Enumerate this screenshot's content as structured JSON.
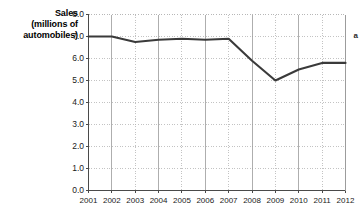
{
  "chart_data": {
    "type": "line",
    "title": "",
    "xlabel": "",
    "ylabel": "Sales (millions of automobiles)",
    "ylabel_lines": [
      "Sales",
      "(millions of",
      "automobiles)"
    ],
    "categories": [
      "2001",
      "2002",
      "2003",
      "2004",
      "2005",
      "2006",
      "2007",
      "2008",
      "2009",
      "2010",
      "2011",
      "2012"
    ],
    "values": [
      7.0,
      7.0,
      6.75,
      6.85,
      6.9,
      6.85,
      6.9,
      5.9,
      5.0,
      5.5,
      5.8,
      5.8
    ],
    "series": [
      {
        "name": "Sales",
        "values": [
          7.0,
          7.0,
          6.75,
          6.85,
          6.9,
          6.85,
          6.9,
          5.9,
          5.0,
          5.5,
          5.8,
          5.8
        ],
        "color": "#3a3a3a"
      }
    ],
    "ylim": [
      0.0,
      8.0
    ],
    "ytick_step": 1.0,
    "yticks": [
      "8.0",
      "7.0",
      "6.0",
      "5.0",
      "4.0",
      "3.0",
      "2.0",
      "1.0",
      "0.0"
    ],
    "ytick_values": [
      8.0,
      7.0,
      6.0,
      5.0,
      4.0,
      3.0,
      2.0,
      1.0,
      0.0
    ],
    "grid": true,
    "grid_style": "dotted",
    "grid_color": "#b4b4b4",
    "axis_color": "#4a4a4a",
    "legend": false,
    "legend_position": "none"
  },
  "annotations": {
    "right_marker": "a"
  }
}
